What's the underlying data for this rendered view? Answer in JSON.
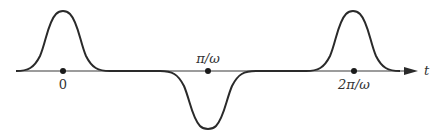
{
  "diagram": {
    "axis": {
      "label": "t"
    },
    "ticks": [
      {
        "label": "0",
        "position": "below"
      },
      {
        "label": "π/ω",
        "position": "above"
      },
      {
        "label": "2π/ω",
        "position": "below"
      }
    ],
    "pulses": [
      {
        "center": "0",
        "polarity": "positive"
      },
      {
        "center": "π/ω",
        "polarity": "negative"
      },
      {
        "center": "2π/ω",
        "polarity": "positive"
      }
    ],
    "colors": {
      "curve": "#2a2a2a",
      "axis": "#3a3a3a",
      "text": "#333333"
    }
  }
}
